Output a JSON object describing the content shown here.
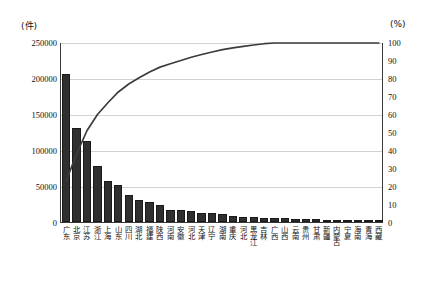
{
  "chart_data": {
    "type": "bar",
    "title": "",
    "subtitle": "",
    "xlabel": "",
    "ylabel": "(件)",
    "y2label": "(%)",
    "ylim": [
      0,
      250000
    ],
    "y2lim": [
      0,
      100
    ],
    "grid": true,
    "legend": "none",
    "left_axis_unit": "(件)",
    "right_axis_unit": "(%)",
    "left_ticks": [
      "250000",
      "200000",
      "150000",
      "100000",
      "50000",
      "0"
    ],
    "left_tick_values": [
      250000,
      200000,
      150000,
      100000,
      50000,
      0
    ],
    "right_ticks": [
      "100",
      "90",
      "80",
      "70",
      "60",
      "50",
      "40",
      "30",
      "20",
      "10",
      "0"
    ],
    "right_tick_values": [
      100,
      90,
      80,
      70,
      60,
      50,
      40,
      30,
      20,
      10,
      0
    ],
    "categories": [
      "广东",
      "北京",
      "江苏",
      "浙江",
      "上海",
      "山东",
      "四川",
      "湖北",
      "福建",
      "陕西",
      "河南",
      "安徽",
      "河北",
      "天津",
      "辽宁",
      "湖南",
      "重庆",
      "河北",
      "黑龙江",
      "吉林",
      "广西",
      "山西",
      "云南",
      "贵州",
      "甘肃",
      "新疆",
      "内蒙古",
      "宁夏",
      "海南",
      "青海",
      "西藏"
    ],
    "series": [
      {
        "name": "件数",
        "type": "bar",
        "color": "#2f2f2f",
        "values": [
          205000,
          130000,
          113000,
          78000,
          57000,
          52000,
          38000,
          31000,
          28000,
          23000,
          17000,
          16000,
          15500,
          13000,
          12500,
          11000,
          9000,
          7000,
          6800,
          6000,
          5500,
          5000,
          4500,
          4000,
          3600,
          3200,
          2800,
          2400,
          1800,
          1200,
          700
        ]
      },
      {
        "name": "累计比率",
        "type": "line",
        "color": "#3c3c3c",
        "values": [
          23.5,
          38.4,
          51.4,
          60.3,
          66.8,
          72.8,
          77.2,
          80.7,
          83.9,
          86.6,
          88.5,
          90.3,
          92.1,
          93.6,
          95.0,
          96.3,
          97.3,
          98.1,
          98.9,
          99.6,
          100.0,
          100.0,
          100.0,
          100.0,
          100.0,
          100.0,
          100.0,
          100.0,
          100.0,
          100.0,
          100.0
        ]
      }
    ]
  }
}
